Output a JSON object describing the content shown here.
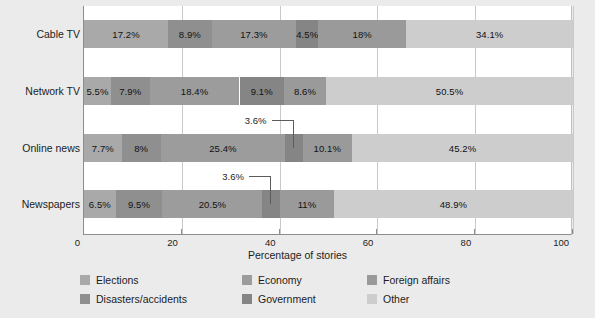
{
  "chart_data": {
    "type": "bar",
    "orientation": "horizontal",
    "stacked": true,
    "title": "",
    "xlabel": "Percentage of stories",
    "ylabel": "",
    "xlim": [
      0,
      100
    ],
    "xticks": [
      0,
      20,
      40,
      60,
      80,
      100
    ],
    "xticklabels": [
      "0",
      "20",
      "40",
      "60",
      "80",
      "100"
    ],
    "grid": "vertical",
    "legend_position": "bottom",
    "categories": [
      "Cable TV",
      "Network TV",
      "Online news",
      "Newspapers"
    ],
    "series": [
      {
        "name": "Elections",
        "color": "#a9a9a9",
        "values": [
          17.2,
          5.5,
          7.7,
          6.5
        ],
        "labels": [
          "17.2%",
          "5.5%",
          "7.7%",
          "6.5%"
        ]
      },
      {
        "name": "Disasters/accidents",
        "color": "#8f8f8f",
        "values": [
          8.9,
          7.9,
          8.0,
          9.5
        ],
        "labels": [
          "8.9%",
          "7.9%",
          "8%",
          "9.5%"
        ]
      },
      {
        "name": "Economy",
        "color": "#9c9c9c",
        "values": [
          17.3,
          18.4,
          25.4,
          20.5
        ],
        "labels": [
          "17.3%",
          "18.4%",
          "25.4%",
          "20.5%"
        ]
      },
      {
        "name": "Government",
        "color": "#858585",
        "values": [
          4.5,
          9.1,
          3.6,
          3.6
        ],
        "labels": [
          "4.5%",
          "9.1%",
          "3.6%",
          "3.6%"
        ]
      },
      {
        "name": "Foreign affairs",
        "color": "#9a9a9a",
        "values": [
          18.0,
          8.6,
          10.1,
          11.0
        ],
        "labels": [
          "18%",
          "8.6%",
          "10.1%",
          "11%"
        ]
      },
      {
        "name": "Other",
        "color": "#cdcdcd",
        "values": [
          34.1,
          50.5,
          45.2,
          48.9
        ],
        "labels": [
          "34.1%",
          "50.5%",
          "45.2%",
          "48.9%"
        ]
      }
    ],
    "callouts": [
      {
        "category": "Online news",
        "series": "Government",
        "label": "3.6%"
      },
      {
        "category": "Newspapers",
        "series": "Government",
        "label": "3.6%"
      }
    ]
  },
  "legend": {
    "items": [
      {
        "label": "Elections",
        "color": "#a9a9a9"
      },
      {
        "label": "Economy",
        "color": "#9c9c9c"
      },
      {
        "label": "Foreign affairs",
        "color": "#9a9a9a"
      },
      {
        "label": "Disasters/accidents",
        "color": "#8f8f8f"
      },
      {
        "label": "Government",
        "color": "#858585"
      },
      {
        "label": "Other",
        "color": "#cdcdcd"
      }
    ]
  },
  "axis": {
    "x_title": "Percentage of stories"
  }
}
